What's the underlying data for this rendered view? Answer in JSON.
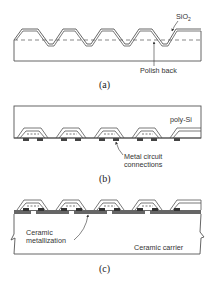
{
  "figure": {
    "panels": [
      {
        "id": "a",
        "caption": "(a)",
        "labels": {
          "oxide": "SiO",
          "oxide_subscript": "2",
          "polish": "Polish back"
        }
      },
      {
        "id": "b",
        "caption": "(b)",
        "labels": {
          "poly": "poly-Si",
          "metal_line1": "Metal circuit",
          "metal_line2": "connections"
        }
      },
      {
        "id": "c",
        "caption": "(c)",
        "labels": {
          "metallization_line1": "Ceramic",
          "metallization_line2": "metallization",
          "carrier": "Ceramic carrier"
        }
      }
    ],
    "colors": {
      "line": "#555555",
      "metal": "#444444",
      "background": "#ffffff"
    }
  }
}
